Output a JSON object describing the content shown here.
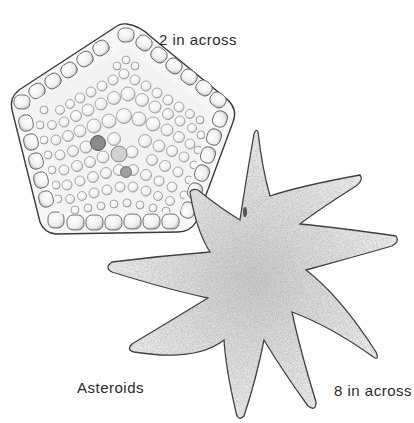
{
  "illustration": {
    "subject": "Asteroids",
    "specimens": [
      {
        "name": "pentagonal-starfish",
        "size_label": "2 in across",
        "shape": "pentagon",
        "arms": 5
      },
      {
        "name": "nine-armed-starfish",
        "size_label": "8 in across",
        "shape": "star",
        "arms": 9
      }
    ],
    "colors": {
      "background": "#ffffff",
      "ink": "#2a2a2a",
      "fill_light": "#f2f2f2",
      "stipple": "#8a8a8a"
    }
  }
}
